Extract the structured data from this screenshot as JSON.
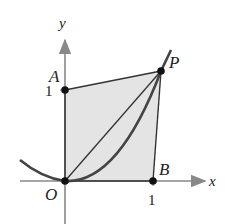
{
  "figure": {
    "axes": {
      "x_label": "x",
      "y_label": "y",
      "x_tick": "1",
      "y_tick": "1"
    },
    "points": {
      "origin": "O",
      "a": "A",
      "b": "B",
      "p": "P"
    },
    "colors": {
      "axis": "#888888",
      "curve": "#444444",
      "region_fill": "#e6e6e6",
      "lines": "#333333",
      "points": "#111111"
    }
  }
}
